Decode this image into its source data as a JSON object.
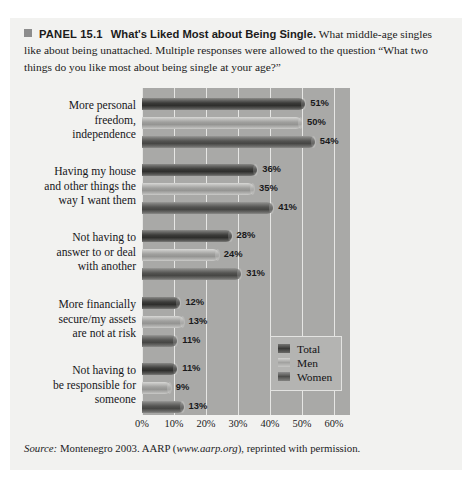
{
  "panel": {
    "marker_icon": "square-marker",
    "label": "PANEL 15.1",
    "title": "What's Liked Most about Being Single.",
    "body": "What middle-age singles like about being unattached. Multiple responses were allowed to the question “What two things do you like most about being single at your age?”"
  },
  "source": {
    "prefix": "Source:",
    "text_before_link": " Montenegro 2003. AARP (",
    "link": "www.aarp.org",
    "text_after_link": "), reprinted with permission."
  },
  "legend": {
    "items": [
      {
        "label": "Total",
        "swatch": "total",
        "color": "#3a3a38"
      },
      {
        "label": "Men",
        "swatch": "men",
        "color": "#a2a2a0"
      },
      {
        "label": "Women",
        "swatch": "women",
        "color": "#4e4e4c"
      }
    ]
  },
  "chart_data": {
    "type": "bar",
    "orientation": "horizontal",
    "title": "What's Liked Most about Being Single",
    "xlabel": "",
    "ylabel": "",
    "xlim": [
      0,
      65
    ],
    "xticks": [
      0,
      10,
      20,
      30,
      40,
      50,
      60
    ],
    "xticklabels": [
      "0%",
      "10%",
      "20%",
      "30%",
      "40%",
      "50%",
      "60%"
    ],
    "grid": "vertical",
    "legend_position": "inside-lower-right",
    "plot_background": "#a9a9a7",
    "categories": [
      "More personal freedom, independence",
      "Having my house and other things the way I want them",
      "Not having to answer to or deal with another",
      "More financially secure/my assets are not at risk",
      "Not having to be responsible for someone"
    ],
    "category_lines": [
      [
        "More personal",
        "freedom,",
        "independence"
      ],
      [
        "Having my house",
        "and other things the",
        "way I want them"
      ],
      [
        "Not having to",
        "answer to or deal",
        "with another"
      ],
      [
        "More financially",
        "secure/my assets",
        "are not at risk"
      ],
      [
        "Not having to",
        "be responsible for",
        "someone"
      ]
    ],
    "series": [
      {
        "name": "Total",
        "values": [
          51,
          36,
          28,
          12,
          11
        ],
        "labels": [
          "51%",
          "36%",
          "28%",
          "12%",
          "11%"
        ]
      },
      {
        "name": "Men",
        "values": [
          50,
          35,
          24,
          13,
          9
        ],
        "labels": [
          "50%",
          "35%",
          "24%",
          "13%",
          "9%"
        ]
      },
      {
        "name": "Women",
        "values": [
          54,
          41,
          31,
          11,
          13
        ],
        "labels": [
          "54%",
          "41%",
          "31%",
          "11%",
          "13%"
        ]
      }
    ]
  }
}
